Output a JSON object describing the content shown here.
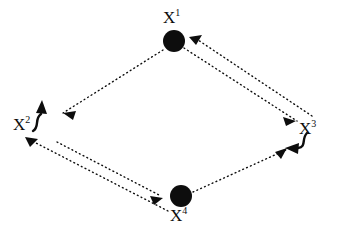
{
  "diagram": {
    "title": "",
    "type": "directed-graph",
    "background_color": "#ffffff",
    "ink_color": "#0d0d0d",
    "nodes": [
      {
        "id": "x1",
        "base": "X",
        "superscript": "1",
        "label": "X1",
        "position": "top",
        "marker": "filled-circle",
        "cx": 174,
        "cy": 41,
        "r": 11
      },
      {
        "id": "x2",
        "base": "X",
        "superscript": "2",
        "label": "X2",
        "position": "left",
        "marker": "none",
        "cx": 30,
        "cy": 124,
        "r": 0
      },
      {
        "id": "x3",
        "base": "X",
        "superscript": "3",
        "label": "X3",
        "position": "right",
        "marker": "none",
        "cx": 308,
        "cy": 128,
        "r": 0
      },
      {
        "id": "x4",
        "base": "X",
        "superscript": "4",
        "label": "X4",
        "position": "bottom",
        "marker": "filled-circle",
        "cx": 181,
        "cy": 196,
        "r": 11
      }
    ],
    "edges": [
      {
        "id": "e-x1-x2",
        "from": "x1",
        "to": "x2",
        "style": "dotted",
        "arrow": "target"
      },
      {
        "id": "e-x1-x3",
        "from": "x1",
        "to": "x3",
        "style": "dotted",
        "arrow": "target"
      },
      {
        "id": "e-x3-x1",
        "from": "x3",
        "to": "x1",
        "style": "dotted",
        "arrow": "target"
      },
      {
        "id": "e-x2-x4",
        "from": "x2",
        "to": "x4",
        "style": "dotted",
        "arrow": "target"
      },
      {
        "id": "e-x4-x2",
        "from": "x4",
        "to": "x2",
        "style": "dotted",
        "arrow": "target"
      },
      {
        "id": "e-x4-x3",
        "from": "x4",
        "to": "x3",
        "style": "dotted",
        "arrow": "target"
      }
    ],
    "annotations": [
      {
        "id": "curve-x2",
        "attached_to": "x2",
        "style": "solid-curved-arrow",
        "direction": "up-right"
      },
      {
        "id": "curve-x3",
        "attached_to": "x3",
        "style": "solid-curved-arrow",
        "direction": "down-left"
      }
    ]
  }
}
